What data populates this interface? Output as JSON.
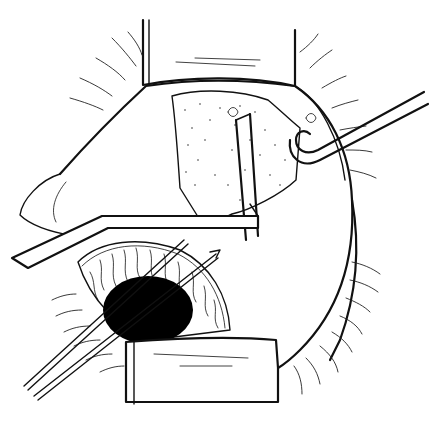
{
  "figure": {
    "colors": {
      "background": "#ffffff",
      "ink": "#111111",
      "pupil": "#000000"
    },
    "elements": [
      "upper-eyelid-retractor",
      "lower-eyelid-retractor",
      "upper-lashes",
      "lower-lashes",
      "globe-outline",
      "stippled-scleral-flap",
      "hook-instrument",
      "spatula-instrument",
      "iris",
      "pupil",
      "needle-instruments",
      "sutures"
    ]
  }
}
